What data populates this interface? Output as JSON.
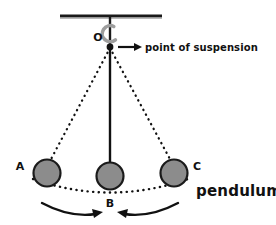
{
  "diagram": {
    "title": "pendulum",
    "background_color": "#ffffff",
    "ink_color": "#111111",
    "bob_fill_color": "#8c8c8c",
    "bob_stroke_color": "#1a1a1a",
    "hook_color": "#9e9e9e",
    "support": {
      "name": "support-bar",
      "x1": 60,
      "x2": 162,
      "y": 16,
      "thickness": 3
    },
    "pivot": {
      "label": "O",
      "annotation": "point of suspension",
      "x": 110,
      "y": 47,
      "dot_radius": 3.4
    },
    "hook": {
      "name": "suspension-hook",
      "cx": 110,
      "cy": 33,
      "radius": 8
    },
    "arrow_to_label": {
      "x1": 118,
      "x2": 140,
      "y": 47
    },
    "bobs": [
      {
        "label": "A",
        "cx": 47,
        "cy": 173,
        "r": 14,
        "string": "dotted",
        "label_x": 20,
        "label_y": 166
      },
      {
        "label": "B",
        "cx": 110,
        "cy": 176,
        "r": 14,
        "string": "solid",
        "label_x": 106,
        "label_y": 203
      },
      {
        "label": "C",
        "cx": 174,
        "cy": 173,
        "r": 14,
        "string": "dotted",
        "label_x": 193,
        "label_y": 166
      }
    ],
    "swing_arc": {
      "name": "swing-path",
      "style": "dotted",
      "from_x": 33,
      "to_x": 188,
      "y": 190,
      "sag": 14
    },
    "motion_arrows": [
      {
        "name": "swing-arrow-left",
        "direction": "right"
      },
      {
        "name": "swing-arrow-right",
        "direction": "left"
      }
    ],
    "title_position": {
      "x": 196,
      "y": 196
    }
  }
}
